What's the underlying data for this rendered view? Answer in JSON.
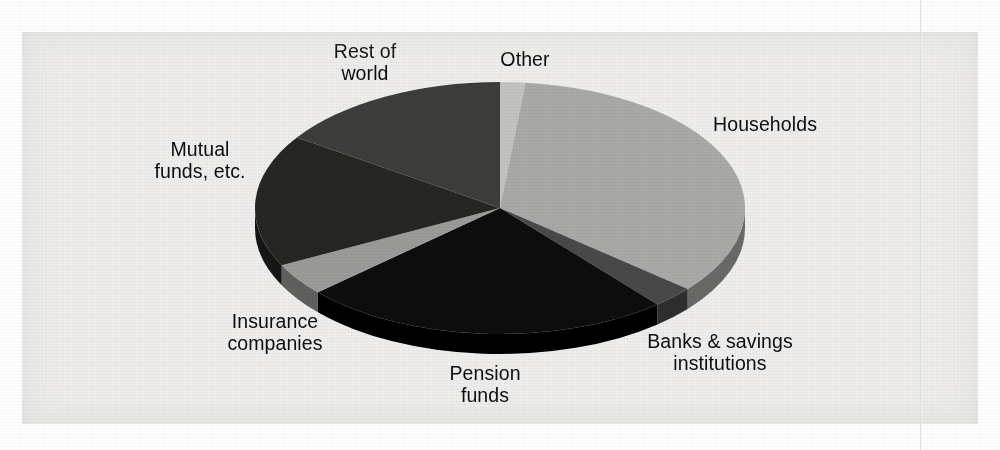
{
  "figure": {
    "background_color": "#efeeec",
    "page_color": "#ffffff",
    "text_color": "#0d0d0d"
  },
  "labels": {
    "rest_of_world": "Rest of\nworld",
    "other": "Other",
    "households": "Households",
    "banks": "Banks & savings\ninstitutions",
    "pension_funds": "Pension\nfunds",
    "insurance": "Insurance\ncompanies",
    "mutual_funds": "Mutual\nfunds, etc."
  },
  "chart_data": {
    "type": "pie",
    "title": "",
    "subtitle": "",
    "xlabel": "",
    "ylabel": "",
    "legend_position": "none",
    "labels_position": "outside",
    "grid": false,
    "three_d": true,
    "start_angle_deg": 0,
    "direction": "clockwise",
    "categories": [
      "Other",
      "Households",
      "Banks & savings institutions",
      "Pension funds",
      "Insurance companies",
      "Mutual funds, etc.",
      "Rest of world"
    ],
    "values": [
      2,
      34,
      3,
      24,
      4,
      17,
      16
    ],
    "units": "percent",
    "slices": [
      {
        "label": "Other",
        "value": 2,
        "start_deg": 0,
        "end_deg": 6,
        "color": "#c3c3c1"
      },
      {
        "label": "Households",
        "value": 34,
        "start_deg": 6,
        "end_deg": 130,
        "color": "#a9a9a7"
      },
      {
        "label": "Banks & savings institutions",
        "value": 3,
        "start_deg": 130,
        "end_deg": 140,
        "color": "#4a4a48"
      },
      {
        "label": "Pension funds",
        "value": 24,
        "start_deg": 140,
        "end_deg": 228,
        "color": "#090909"
      },
      {
        "label": "Insurance companies",
        "value": 4,
        "start_deg": 228,
        "end_deg": 243,
        "color": "#9b9b99"
      },
      {
        "label": "Mutual funds, etc.",
        "value": 17,
        "start_deg": 243,
        "end_deg": 304,
        "color": "#252523"
      },
      {
        "label": "Rest of world",
        "value": 16,
        "start_deg": 304,
        "end_deg": 360,
        "color": "#3c3c3a"
      }
    ],
    "geometry": {
      "center_x": 500,
      "center_y": 208,
      "radius_x": 245,
      "radius_y": 126,
      "depth": 20
    }
  }
}
